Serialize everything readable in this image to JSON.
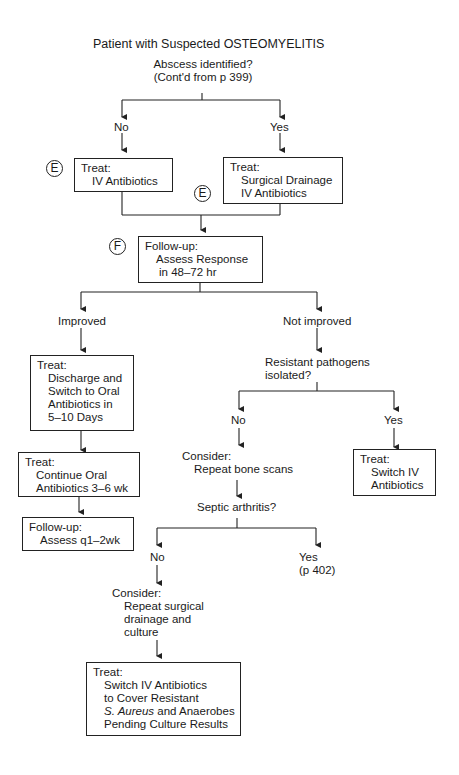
{
  "title": "Patient with Suspected OSTEOMYELITIS",
  "root_question": {
    "line1": "Abscess identified?",
    "line2": "(Cont'd from p 399)"
  },
  "branch_no": "No",
  "branch_yes": "Yes",
  "markers": {
    "e": "E",
    "f": "F"
  },
  "box_iv": {
    "heading": "Treat:",
    "lines": [
      "IV Antibiotics"
    ]
  },
  "box_drainage": {
    "heading": "Treat:",
    "lines": [
      "Surgical Drainage",
      "IV Antibiotics"
    ]
  },
  "box_followup": {
    "heading": "Follow-up:",
    "lines": [
      "Assess Response",
      "in 48–72 hr"
    ]
  },
  "improved": "Improved",
  "not_improved": "Not improved",
  "box_discharge": {
    "heading": "Treat:",
    "lines": [
      "Discharge and",
      "Switch to Oral",
      "Antibiotics in",
      "5–10 Days"
    ]
  },
  "box_continue": {
    "heading": "Treat:",
    "lines": [
      "Continue Oral",
      "Antibiotics 3–6 wk"
    ]
  },
  "box_assess": {
    "heading": "Follow-up:",
    "lines": [
      "Assess q1–2wk"
    ]
  },
  "resistant_question": {
    "line1": "Resistant pathogens",
    "line2": "isolated?"
  },
  "resistant_no": "No",
  "resistant_yes": "Yes",
  "consider_bone": {
    "heading": "Consider:",
    "line": "Repeat bone scans"
  },
  "box_switch": {
    "heading": "Treat:",
    "lines": [
      "Switch IV",
      "Antibiotics"
    ]
  },
  "septic_question": "Septic arthritis?",
  "septic_no": "No",
  "septic_yes": {
    "line1": "Yes",
    "line2": "(p 402)"
  },
  "consider_surgical": {
    "heading": "Consider:",
    "lines": [
      "Repeat surgical",
      "drainage and",
      "culture"
    ]
  },
  "box_final": {
    "heading": "Treat:",
    "lines": [
      "Switch IV Antibiotics",
      "to Cover Resistant"
    ],
    "italic_part": "S. Aureus",
    "line3_rest": " and Anaerobes",
    "line4": "Pending Culture Results"
  }
}
